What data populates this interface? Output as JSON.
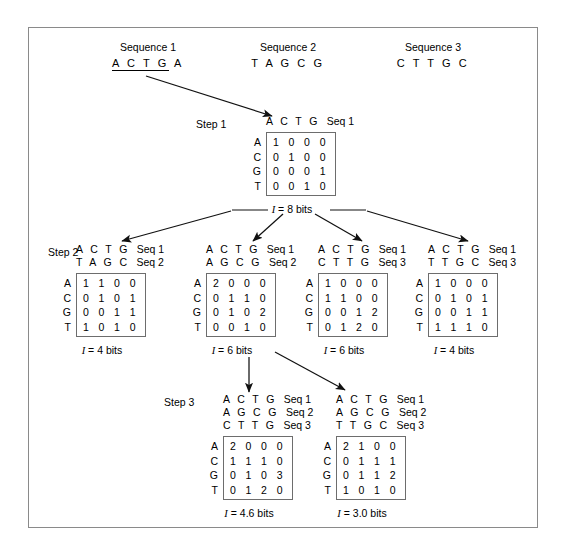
{
  "figure": {
    "sequences": [
      {
        "title": "Sequence 1",
        "letters": "A C T G A",
        "underlined_prefix": "A C T G",
        "tail": " A"
      },
      {
        "title": "Sequence 2",
        "letters": "T A G C G"
      },
      {
        "title": "Sequence 3",
        "letters": "C T T G C"
      }
    ],
    "steps": [
      {
        "id": "step1",
        "label": "Step 1"
      },
      {
        "id": "step2",
        "label": "Step 2"
      },
      {
        "id": "step3",
        "label": "Step 3"
      }
    ],
    "row_labels": [
      "A",
      "C",
      "G",
      "T"
    ],
    "nodes": [
      {
        "id": "n1",
        "step": "Step 1",
        "headers": [
          {
            "bases": "A C T G",
            "seq": "Seq 1"
          }
        ],
        "rows": [
          {
            "label": "A",
            "values": "1 0 0 0"
          },
          {
            "label": "C",
            "values": "0 1 0 0"
          },
          {
            "label": "G",
            "values": "0 0 0 1"
          },
          {
            "label": "T",
            "values": "0 0 1 0"
          }
        ],
        "bits_prefix": "I",
        "bits_text": " = 8 bits"
      },
      {
        "id": "n2a",
        "step": "Step 2",
        "headers": [
          {
            "bases": "A C T G",
            "seq": "Seq 1"
          },
          {
            "bases": "T A G C",
            "seq": "Seq 2"
          }
        ],
        "rows": [
          {
            "label": "A",
            "values": "1 1 0 0"
          },
          {
            "label": "C",
            "values": "0 1 0 1"
          },
          {
            "label": "G",
            "values": "0 0 1 1"
          },
          {
            "label": "T",
            "values": "1 0 1 0"
          }
        ],
        "bits_prefix": "I",
        "bits_text": " = 4 bits"
      },
      {
        "id": "n2b",
        "step": "",
        "headers": [
          {
            "bases": "A C T G",
            "seq": "Seq 1"
          },
          {
            "bases": "A G C G",
            "seq": "Seq 2"
          }
        ],
        "rows": [
          {
            "label": "A",
            "values": "2 0 0 0"
          },
          {
            "label": "C",
            "values": "0 1 1 0"
          },
          {
            "label": "G",
            "values": "0 1 0 2"
          },
          {
            "label": "T",
            "values": "0 0 1 0"
          }
        ],
        "bits_prefix": "I",
        "bits_text": " = 6 bits"
      },
      {
        "id": "n2c",
        "step": "",
        "headers": [
          {
            "bases": "A C T G",
            "seq": "Seq 1"
          },
          {
            "bases": "C T T G",
            "seq": "Seq 3"
          }
        ],
        "rows": [
          {
            "label": "A",
            "values": "1 0 0 0"
          },
          {
            "label": "C",
            "values": "1 1 0 0"
          },
          {
            "label": "G",
            "values": "0 0 1 2"
          },
          {
            "label": "T",
            "values": "0 1 2 0"
          }
        ],
        "bits_prefix": "I",
        "bits_text": " = 6 bits"
      },
      {
        "id": "n2d",
        "step": "",
        "headers": [
          {
            "bases": "A C T G",
            "seq": "Seq 1"
          },
          {
            "bases": "T T G C",
            "seq": "Seq 3"
          }
        ],
        "rows": [
          {
            "label": "A",
            "values": "1 0 0 0"
          },
          {
            "label": "C",
            "values": "0 1 0 1"
          },
          {
            "label": "G",
            "values": "0 0 1 1"
          },
          {
            "label": "T",
            "values": "1 1 1 0"
          }
        ],
        "bits_prefix": "I",
        "bits_text": " = 4 bits"
      },
      {
        "id": "n3a",
        "step": "Step 3",
        "headers": [
          {
            "bases": "A C T G",
            "seq": "Seq 1"
          },
          {
            "bases": "A G C G",
            "seq": "Seq 2"
          },
          {
            "bases": "C T T G",
            "seq": "Seq 3"
          }
        ],
        "rows": [
          {
            "label": "A",
            "values": "2 0 0 0"
          },
          {
            "label": "C",
            "values": "1 1 1 0"
          },
          {
            "label": "G",
            "values": "0 1 0 3"
          },
          {
            "label": "T",
            "values": "0 1 2 0"
          }
        ],
        "bits_prefix": "I",
        "bits_text": " = 4.6 bits"
      },
      {
        "id": "n3b",
        "step": "",
        "headers": [
          {
            "bases": "A C T G",
            "seq": "Seq 1"
          },
          {
            "bases": "A G C G",
            "seq": "Seq 2"
          },
          {
            "bases": "T T G C",
            "seq": "Seq 3"
          }
        ],
        "rows": [
          {
            "label": "A",
            "values": "2 1 0 0"
          },
          {
            "label": "C",
            "values": "0 1 1 1"
          },
          {
            "label": "G",
            "values": "0 1 1 2"
          },
          {
            "label": "T",
            "values": "1 0 1 0"
          }
        ],
        "bits_prefix": "I",
        "bits_text": " = 3.0 bits"
      }
    ]
  }
}
